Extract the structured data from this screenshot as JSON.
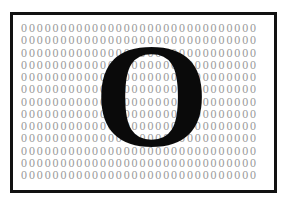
{
  "figure": {
    "background_char": "0",
    "row_text": "000000000000000000000000000000",
    "row_count": 13,
    "rows": [
      "000000000000000000000000000000",
      "000000000000000000000000000000",
      "000000000000000000000000000000",
      "000000000000000000000000000000",
      "000000000000000000000000000000",
      "000000000000000000000000000000",
      "000000000000000000000000000000",
      "000000000000000000000000000000",
      "000000000000000000000000000000",
      "000000000000000000000000000000",
      "000000000000000000000000000000",
      "000000000000000000000000000000",
      "000000000000000000000000000000"
    ],
    "foreground_letter": "O",
    "colors": {
      "background_chars": "#9a9a9a",
      "foreground_letter": "#0a0a0a",
      "frame_border": "#111111",
      "page_background": "#ffffff"
    }
  }
}
